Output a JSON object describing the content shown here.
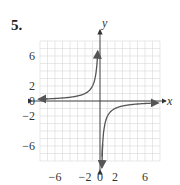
{
  "problem": {
    "number": "5."
  },
  "chart_data": {
    "type": "line",
    "title": "",
    "function": "y = -2/x",
    "xlabel": "x",
    "ylabel": "y",
    "xlim": [
      -8,
      8
    ],
    "ylim": [
      -8,
      8
    ],
    "grid": true,
    "x_ticks": [
      {
        "value": -6,
        "label": "−6"
      },
      {
        "value": -2,
        "label": "−2"
      },
      {
        "value": 0,
        "label": "0"
      },
      {
        "value": 2,
        "label": "2"
      },
      {
        "value": 6,
        "label": "6"
      }
    ],
    "y_ticks": [
      {
        "value": 6,
        "label": "6"
      },
      {
        "value": 2,
        "label": "2"
      },
      {
        "value": 0,
        "label": "0"
      },
      {
        "value": -2,
        "label": "−2"
      },
      {
        "value": -6,
        "label": "−6"
      }
    ],
    "series": [
      {
        "name": "branch-quadrant-II",
        "x": [
          -7.5,
          -6,
          -4,
          -3,
          -2,
          -1,
          -0.5,
          -0.3
        ],
        "y": [
          0.27,
          0.33,
          0.5,
          0.67,
          1,
          2,
          4,
          6.7
        ]
      },
      {
        "name": "branch-quadrant-IV",
        "x": [
          0.3,
          0.5,
          1,
          2,
          3,
          4,
          6,
          7.5
        ],
        "y": [
          -6.7,
          -4,
          -2,
          -1,
          -0.67,
          -0.5,
          -0.33,
          -0.27
        ]
      }
    ],
    "colors": {
      "curve": "#555555",
      "grid": "#d8d8d8",
      "axis": "#333333"
    }
  }
}
